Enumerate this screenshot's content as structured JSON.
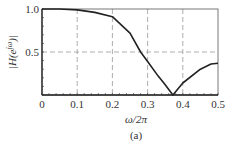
{
  "chart_data": {
    "type": "line",
    "title": "",
    "caption": "(a)",
    "xlabel": "ω/2π",
    "ylabel": "|H(e^{jω})|",
    "xlim": [
      0,
      0.5
    ],
    "ylim": [
      0,
      1.0
    ],
    "xticks": [
      "0",
      "0.1",
      "0.2",
      "0.3",
      "0.4",
      "0.5"
    ],
    "yticks": [
      "0.5",
      "1.0"
    ],
    "grid": {
      "vertical_dashed": [
        0.1,
        0.2,
        0.3,
        0.4
      ],
      "horizontal_dashed": [
        0.5
      ]
    },
    "series": [
      {
        "name": "magnitude",
        "x": [
          0,
          0.05,
          0.1,
          0.15,
          0.2,
          0.25,
          0.28,
          0.3,
          0.33,
          0.35,
          0.372,
          0.4,
          0.45,
          0.48,
          0.5
        ],
        "values": [
          1.0,
          1.0,
          0.99,
          0.96,
          0.91,
          0.72,
          0.5,
          0.39,
          0.22,
          0.12,
          0.0,
          0.14,
          0.3,
          0.36,
          0.37
        ]
      }
    ]
  }
}
